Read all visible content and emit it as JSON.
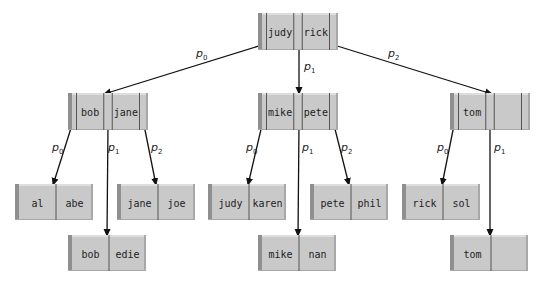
{
  "diagram": {
    "type": "b-tree",
    "colors": {
      "fill": "#c9c9c9",
      "left_shade": "#8f8f8f",
      "top_light": "#dedede",
      "right_shade": "#a8a8a8",
      "divider": "#555555",
      "edge": "#111111"
    },
    "internal_nodes": [
      {
        "id": "root",
        "x": 258,
        "y": 13,
        "w": 80,
        "h": 37,
        "keys": [
          "judy",
          "rick"
        ]
      },
      {
        "id": "n-bob-jane",
        "x": 68,
        "y": 93,
        "w": 80,
        "h": 37,
        "keys": [
          "bob",
          "jane"
        ]
      },
      {
        "id": "n-mike-pete",
        "x": 258,
        "y": 93,
        "w": 80,
        "h": 37,
        "keys": [
          "mike",
          "pete"
        ]
      },
      {
        "id": "n-tom",
        "x": 450,
        "y": 93,
        "w": 80,
        "h": 37,
        "keys": [
          "tom",
          ""
        ]
      }
    ],
    "leaf_nodes": [
      {
        "id": "leaf-al-abe",
        "x": 15,
        "y": 184,
        "w": 78,
        "h": 36,
        "keys": [
          "al",
          "abe"
        ]
      },
      {
        "id": "leaf-bob-edie",
        "x": 68,
        "y": 235,
        "w": 78,
        "h": 36,
        "keys": [
          "bob",
          "edie"
        ]
      },
      {
        "id": "leaf-jane-joe",
        "x": 117,
        "y": 184,
        "w": 78,
        "h": 36,
        "keys": [
          "jane",
          "joe"
        ]
      },
      {
        "id": "leaf-judy-karen",
        "x": 208,
        "y": 184,
        "w": 78,
        "h": 36,
        "keys": [
          "judy",
          "karen"
        ]
      },
      {
        "id": "leaf-mike-nan",
        "x": 258,
        "y": 235,
        "w": 78,
        "h": 36,
        "keys": [
          "mike",
          "nan"
        ]
      },
      {
        "id": "leaf-pete-phil",
        "x": 310,
        "y": 184,
        "w": 78,
        "h": 36,
        "keys": [
          "pete",
          "phil"
        ]
      },
      {
        "id": "leaf-rick-sol",
        "x": 402,
        "y": 184,
        "w": 78,
        "h": 36,
        "keys": [
          "rick",
          "sol"
        ]
      },
      {
        "id": "leaf-tom",
        "x": 450,
        "y": 235,
        "w": 78,
        "h": 36,
        "keys": [
          "tom",
          ""
        ]
      }
    ],
    "edges": [
      {
        "from": [
          262,
          45
        ],
        "to": [
          104,
          94
        ],
        "label": "p",
        "sub": "0",
        "lx": 196,
        "ly": 57
      },
      {
        "from": [
          299,
          45
        ],
        "to": [
          299,
          94
        ],
        "label": "p",
        "sub": "1",
        "lx": 304,
        "ly": 70
      },
      {
        "from": [
          334,
          45
        ],
        "to": [
          492,
          94
        ],
        "label": "p",
        "sub": "2",
        "lx": 388,
        "ly": 57
      },
      {
        "from": [
          72,
          125
        ],
        "to": [
          53,
          185
        ],
        "label": "p",
        "sub": "0",
        "lx": 52,
        "ly": 151
      },
      {
        "from": [
          108,
          125
        ],
        "to": [
          107,
          236
        ],
        "label": "p",
        "sub": "1",
        "lx": 108,
        "ly": 151
      },
      {
        "from": [
          144,
          125
        ],
        "to": [
          156,
          185
        ],
        "label": "p",
        "sub": "2",
        "lx": 151,
        "ly": 151
      },
      {
        "from": [
          262,
          125
        ],
        "to": [
          248,
          185
        ],
        "label": "p",
        "sub": "0",
        "lx": 246,
        "ly": 151
      },
      {
        "from": [
          299,
          125
        ],
        "to": [
          298,
          236
        ],
        "label": "p",
        "sub": "1",
        "lx": 302,
        "ly": 151
      },
      {
        "from": [
          334,
          125
        ],
        "to": [
          349,
          185
        ],
        "label": "p",
        "sub": "2",
        "lx": 341,
        "ly": 151
      },
      {
        "from": [
          454,
          125
        ],
        "to": [
          442,
          185
        ],
        "label": "p",
        "sub": "0",
        "lx": 437,
        "ly": 151
      },
      {
        "from": [
          490,
          125
        ],
        "to": [
          490,
          236
        ],
        "label": "p",
        "sub": "1",
        "lx": 494,
        "ly": 151
      }
    ]
  }
}
